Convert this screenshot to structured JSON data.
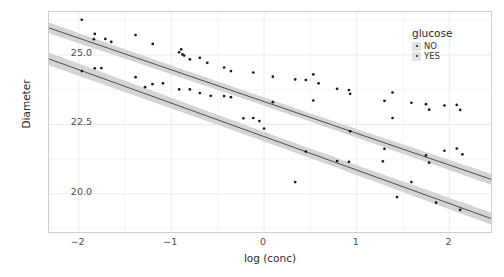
{
  "chart_data": {
    "type": "scatter",
    "title": "",
    "xlabel": "log (conc)",
    "ylabel": "Diameter",
    "xlim": [
      -2.32,
      2.47
    ],
    "ylim": [
      18.55,
      26.55
    ],
    "xticks": [
      -2,
      -1,
      0,
      1,
      2
    ],
    "xticklabels": [
      "−2",
      "−1",
      "0",
      "1",
      "2"
    ],
    "yticks": [
      20.0,
      22.5,
      25.0
    ],
    "yticklabels": [
      "20.0",
      "22.5",
      "25.0"
    ],
    "grid": true,
    "legend": {
      "title": "glucose",
      "position": "top-right",
      "entries": [
        {
          "label": "NO",
          "key": "legend-key-no"
        },
        {
          "label": "YES",
          "key": "legend-key-yes"
        }
      ]
    },
    "point_color": "#1a1a1a",
    "line_color": "#3d3d3d",
    "band_color": "#d4d4d4",
    "grid_color": "#ececec",
    "panel_border_color": "#cfcfcf",
    "series": [
      {
        "name": "NO",
        "fit": {
          "intercept": 23.322,
          "slope": -1.144,
          "se": 0.115
        },
        "points": [
          {
            "x": -1.966,
            "y": 26.27
          },
          {
            "x": -1.826,
            "y": 25.76
          },
          {
            "x": -1.836,
            "y": 25.57
          },
          {
            "x": -1.712,
            "y": 25.58
          },
          {
            "x": -1.648,
            "y": 25.47
          },
          {
            "x": -1.386,
            "y": 25.72
          },
          {
            "x": -1.201,
            "y": 25.4
          },
          {
            "x": -0.916,
            "y": 25.1
          },
          {
            "x": -0.894,
            "y": 25.2
          },
          {
            "x": -0.88,
            "y": 25.02
          },
          {
            "x": -0.862,
            "y": 24.98
          },
          {
            "x": -0.8,
            "y": 24.84
          },
          {
            "x": -0.693,
            "y": 24.9
          },
          {
            "x": -0.612,
            "y": 24.72
          },
          {
            "x": -0.431,
            "y": 24.55
          },
          {
            "x": -0.357,
            "y": 24.42
          },
          {
            "x": -0.116,
            "y": 24.37
          },
          {
            "x": 0.095,
            "y": 24.22
          },
          {
            "x": 0.336,
            "y": 24.12
          },
          {
            "x": 0.451,
            "y": 24.1
          },
          {
            "x": 0.531,
            "y": 24.3
          },
          {
            "x": 0.588,
            "y": 23.98
          },
          {
            "x": 0.788,
            "y": 23.78
          },
          {
            "x": 0.916,
            "y": 23.74
          },
          {
            "x": 0.929,
            "y": 23.6
          },
          {
            "x": 1.299,
            "y": 23.35
          },
          {
            "x": 1.386,
            "y": 23.65
          },
          {
            "x": 1.589,
            "y": 23.28
          },
          {
            "x": 1.747,
            "y": 23.23
          },
          {
            "x": 1.781,
            "y": 23.03
          },
          {
            "x": 1.946,
            "y": 23.18
          },
          {
            "x": 2.079,
            "y": 23.2
          },
          {
            "x": 2.116,
            "y": 23.02
          }
        ]
      },
      {
        "name": "YES",
        "fit": {
          "intercept": 22.06,
          "slope": -1.206,
          "se": 0.135
        },
        "points": [
          {
            "x": -1.966,
            "y": 24.42
          },
          {
            "x": -1.826,
            "y": 24.52
          },
          {
            "x": -1.755,
            "y": 24.53
          },
          {
            "x": -1.386,
            "y": 24.2
          },
          {
            "x": -1.284,
            "y": 23.84
          },
          {
            "x": -1.204,
            "y": 23.95
          },
          {
            "x": -1.091,
            "y": 23.98
          },
          {
            "x": -0.916,
            "y": 23.76
          },
          {
            "x": -0.8,
            "y": 23.76
          },
          {
            "x": -0.693,
            "y": 23.63
          },
          {
            "x": -0.575,
            "y": 23.53
          },
          {
            "x": -0.431,
            "y": 23.52
          },
          {
            "x": -0.357,
            "y": 23.48
          },
          {
            "x": -0.223,
            "y": 22.72
          },
          {
            "x": -0.116,
            "y": 22.73
          },
          {
            "x": -0.05,
            "y": 22.62
          },
          {
            "x": 0.0,
            "y": 22.35
          },
          {
            "x": 0.095,
            "y": 23.3
          },
          {
            "x": 0.336,
            "y": 20.42
          },
          {
            "x": 0.451,
            "y": 21.52
          },
          {
            "x": 0.531,
            "y": 23.36
          },
          {
            "x": 0.788,
            "y": 21.18
          },
          {
            "x": 0.916,
            "y": 21.15
          },
          {
            "x": 0.929,
            "y": 22.25
          },
          {
            "x": 1.282,
            "y": 21.17
          },
          {
            "x": 1.299,
            "y": 21.62
          },
          {
            "x": 1.386,
            "y": 22.73
          },
          {
            "x": 1.435,
            "y": 19.88
          },
          {
            "x": 1.589,
            "y": 20.42
          },
          {
            "x": 1.747,
            "y": 21.38
          },
          {
            "x": 1.781,
            "y": 21.12
          },
          {
            "x": 1.856,
            "y": 19.68
          },
          {
            "x": 1.946,
            "y": 21.55
          },
          {
            "x": 2.079,
            "y": 21.63
          },
          {
            "x": 2.116,
            "y": 19.42
          },
          {
            "x": 2.14,
            "y": 21.42
          }
        ]
      }
    ]
  }
}
